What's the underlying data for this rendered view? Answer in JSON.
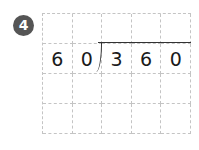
{
  "problem": {
    "number": "4",
    "badge_color": "#555555",
    "divisor": [
      "6",
      "0"
    ],
    "dividend": [
      "3",
      "6",
      "0"
    ],
    "grid": {
      "columns": 5,
      "rows": 4
    },
    "rows": [
      [
        "",
        "",
        "",
        "",
        ""
      ],
      [
        "6",
        "0",
        "3",
        "6",
        "0"
      ],
      [
        "",
        "",
        "",
        "",
        ""
      ],
      [
        "",
        "",
        "",
        "",
        ""
      ]
    ]
  }
}
